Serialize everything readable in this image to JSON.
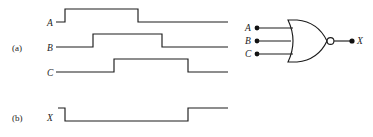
{
  "figure": {
    "type": "digital-logic-timing-diagram",
    "parts": [
      {
        "id": "a",
        "label": "(a)",
        "caption_role": "input-waveforms"
      },
      {
        "id": "b",
        "label": "(b)",
        "caption_role": "output-waveform"
      }
    ]
  },
  "timing": {
    "signals": [
      {
        "name": "A",
        "label": "A",
        "part": "a",
        "baseline_y": 22,
        "pulse_height": 13,
        "start_x": 46,
        "end_x": 228,
        "initial_level": "low",
        "transitions": [
          {
            "x": 65,
            "edge": "rising"
          },
          {
            "x": 138,
            "edge": "falling"
          }
        ]
      },
      {
        "name": "B",
        "label": "B",
        "part": "a",
        "baseline_y": 47,
        "pulse_height": 13,
        "start_x": 46,
        "end_x": 228,
        "initial_level": "low",
        "transitions": [
          {
            "x": 93,
            "edge": "rising"
          },
          {
            "x": 162,
            "edge": "falling"
          }
        ]
      },
      {
        "name": "C",
        "label": "C",
        "part": "a",
        "baseline_y": 72,
        "pulse_height": 13,
        "start_x": 46,
        "end_x": 228,
        "initial_level": "low",
        "transitions": [
          {
            "x": 114,
            "edge": "rising"
          },
          {
            "x": 188,
            "edge": "falling"
          }
        ]
      },
      {
        "name": "X",
        "label": "X",
        "part": "b",
        "baseline_y": 121,
        "pulse_height": 13,
        "start_x": 46,
        "end_x": 228,
        "initial_level": "high",
        "transitions": [
          {
            "x": 65,
            "edge": "falling"
          },
          {
            "x": 188,
            "edge": "rising"
          }
        ]
      }
    ]
  },
  "schematic": {
    "gate": {
      "name": "nor-gate",
      "type": "NOR",
      "inputs_count": 3,
      "has_inversion_bubble": true
    },
    "inputs": [
      {
        "label": "A",
        "y": 28
      },
      {
        "label": "B",
        "y": 41
      },
      {
        "label": "C",
        "y": 54
      }
    ],
    "output": {
      "label": "X",
      "y": 41
    }
  },
  "colors": {
    "stroke": "#1c1c1c",
    "background": "#ffffff",
    "terminal_dot": "#111111"
  }
}
